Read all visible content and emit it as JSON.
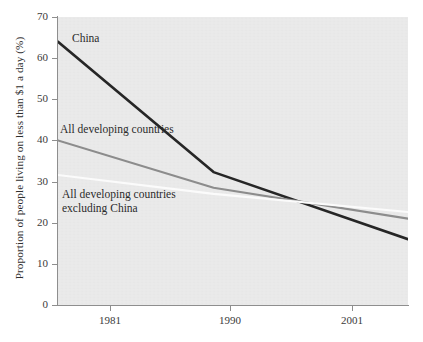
{
  "chart_data": {
    "type": "line",
    "title": "",
    "xlabel": "",
    "ylabel": "Proportion of people living on less than $1 a day (%)",
    "xlim": [
      1978,
      2005
    ],
    "ylim": [
      0,
      70
    ],
    "grid": false,
    "legend_position": "inline-annotations",
    "xticks": [
      {
        "label": "1981",
        "value": 1981,
        "x_px": 110
      },
      {
        "label": "1990",
        "value": 1990,
        "x_px": 230
      },
      {
        "label": "2001",
        "value": 2001,
        "x_px": 352
      }
    ],
    "yticks": [
      {
        "label": "0",
        "value": 0
      },
      {
        "label": "10",
        "value": 10
      },
      {
        "label": "20",
        "value": 20
      },
      {
        "label": "30",
        "value": 30
      },
      {
        "label": "40",
        "value": 40
      },
      {
        "label": "50",
        "value": 50
      },
      {
        "label": "60",
        "value": 60
      },
      {
        "label": "70",
        "value": 70
      }
    ],
    "series": [
      {
        "name": "China",
        "color": "#262626",
        "width": 2.6,
        "x": [
          1978,
          1990,
          2005
        ],
        "values": [
          64.0,
          32.3,
          16.0
        ]
      },
      {
        "name": "All developing countries",
        "color": "#8c8c8c",
        "width": 2.2,
        "x": [
          1978,
          1990,
          2005
        ],
        "values": [
          40.0,
          28.5,
          21.0
        ]
      },
      {
        "name": "All developing countries excluding China",
        "color": "#fbfbfb",
        "width": 2.2,
        "x": [
          1978,
          1990,
          2005
        ],
        "values": [
          31.6,
          27.0,
          22.6
        ]
      }
    ],
    "annotations": [
      {
        "id": "china",
        "text": "China"
      },
      {
        "id": "all_developing",
        "text": "All developing countries"
      },
      {
        "id": "excluding_china",
        "text": "All developing countries\nexcluding China"
      }
    ],
    "colors": {
      "plot_background": "#e9e9e9",
      "page_background": "#ffffff",
      "axis": "#8e8e8e",
      "text": "#3a3a3a"
    }
  },
  "caption_fragment": ""
}
